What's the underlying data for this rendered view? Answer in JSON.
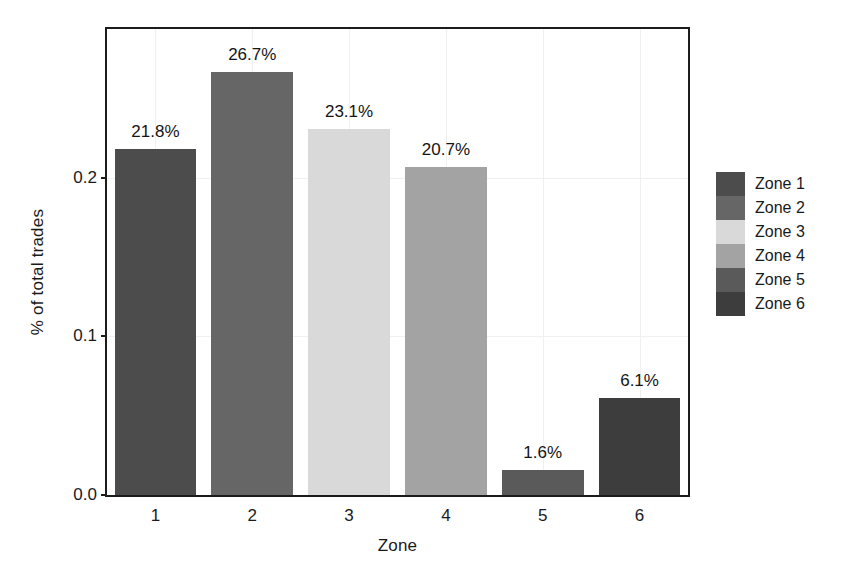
{
  "chart_data": {
    "type": "bar",
    "title": "",
    "xlabel": "Zone",
    "ylabel": "% of total trades",
    "categories": [
      "1",
      "2",
      "3",
      "4",
      "5",
      "6"
    ],
    "values": [
      0.218,
      0.267,
      0.231,
      0.207,
      0.016,
      0.061
    ],
    "data_labels": [
      "21.8%",
      "26.7%",
      "23.1%",
      "20.7%",
      "1.6%",
      "6.1%"
    ],
    "ylim": [
      0.0,
      0.2938
    ],
    "ytick_values": [
      0.0,
      0.1,
      0.2
    ],
    "ytick_labels": [
      "0.0",
      "0.1",
      "0.2"
    ],
    "grid": true,
    "legend_position": "right",
    "legend": [
      {
        "label": "Zone 1",
        "color": "#4c4c4c"
      },
      {
        "label": "Zone 2",
        "color": "#666666"
      },
      {
        "label": "Zone 3",
        "color": "#d9d9d9"
      },
      {
        "label": "Zone 4",
        "color": "#a3a3a3"
      },
      {
        "label": "Zone 5",
        "color": "#5a5a5a"
      },
      {
        "label": "Zone 6",
        "color": "#3d3d3d"
      }
    ],
    "bar_colors": [
      "#4c4c4c",
      "#666666",
      "#d9d9d9",
      "#a3a3a3",
      "#5a5a5a",
      "#3d3d3d"
    ]
  }
}
